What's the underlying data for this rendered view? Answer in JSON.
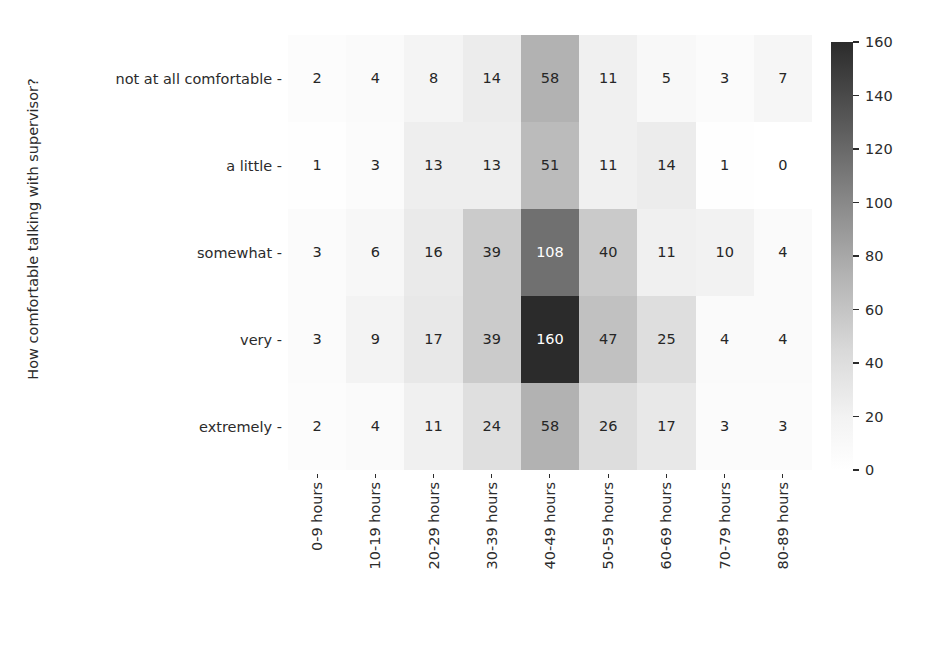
{
  "chart_data": {
    "type": "heatmap",
    "title": "",
    "xlabel": "",
    "ylabel": "How comfortable talking with supervisor?",
    "x_categories": [
      "0-9 hours",
      "10-19 hours",
      "20-29 hours",
      "30-39 hours",
      "40-49 hours",
      "50-59 hours",
      "60-69 hours",
      "70-79 hours",
      "80-89 hours"
    ],
    "y_categories": [
      "not at all comfortable",
      "a little",
      "somewhat",
      "very",
      "extremely"
    ],
    "values": [
      [
        2,
        4,
        8,
        14,
        58,
        11,
        5,
        3,
        7
      ],
      [
        1,
        3,
        13,
        13,
        51,
        11,
        14,
        1,
        0
      ],
      [
        3,
        6,
        16,
        39,
        108,
        40,
        11,
        10,
        4
      ],
      [
        3,
        9,
        17,
        39,
        160,
        47,
        25,
        4,
        4
      ],
      [
        2,
        4,
        11,
        24,
        58,
        26,
        17,
        3,
        3
      ]
    ],
    "annotated": true,
    "grid": false,
    "colormap": "greys",
    "colorbar": {
      "position": "right",
      "vmin": 0,
      "vmax": 160,
      "ticks": [
        0,
        20,
        40,
        60,
        80,
        100,
        120,
        140,
        160
      ],
      "tick_labels": [
        "0",
        "20",
        "40",
        "60",
        "80",
        "100",
        "120",
        "140",
        "160"
      ],
      "low_color": "#ffffff",
      "high_color": "#2b2b2b"
    },
    "text_color_dark": "#262626",
    "text_color_light": "#ffffff",
    "text_light_threshold": 96
  },
  "axis": {
    "ylabel": "How comfortable talking with supervisor?",
    "ytick_dash": "-",
    "xtick_dash": "-"
  }
}
